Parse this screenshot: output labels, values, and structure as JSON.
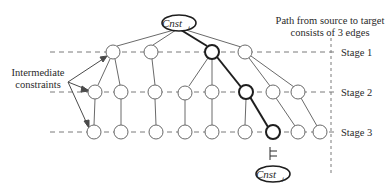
{
  "diagram": {
    "source_node": {
      "label": "Cnst",
      "subscript": "i"
    },
    "target_node": {
      "label": "Cnst",
      "subscript": "j"
    },
    "entails_symbol": "⊨",
    "annotation_path": [
      "Path from source to target",
      "consists of 3 edges"
    ],
    "annotation_intermediate": [
      "Intermediate",
      "constraints"
    ],
    "stages": [
      {
        "label": "Stage 1",
        "y": 52,
        "nodes": [
          113,
          151,
          212,
          245
        ]
      },
      {
        "label": "Stage 2",
        "y": 92,
        "nodes": [
          95,
          121,
          155,
          185,
          212,
          246,
          273,
          298
        ]
      },
      {
        "label": "Stage 3",
        "y": 132,
        "nodes": [
          94,
          121,
          156,
          185,
          212,
          245,
          273,
          298,
          320
        ]
      }
    ],
    "highlighted_path": [
      "Cnst_i",
      "Stage1 node 3",
      "Stage2 node 6",
      "Stage3 node 7",
      "Cnst_j"
    ],
    "colors": {
      "line": "#6a6a6a",
      "bold": "#1e1e1e",
      "dash": "#7a7a7a",
      "text": "#2a2a2a"
    }
  }
}
